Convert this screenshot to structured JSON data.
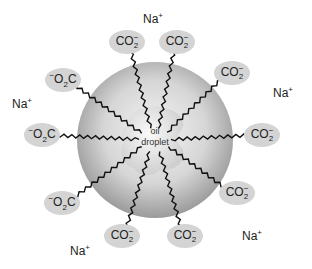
{
  "diagram": {
    "type": "soap-micelle",
    "center_label": [
      "oil",
      "droplet"
    ],
    "colors": {
      "sphere": "#c8c8c8",
      "head_group": "#d4d4d4",
      "tail": "#111111",
      "text": "#222222"
    },
    "head_groups": [
      {
        "id": "h1",
        "label": "CO2-",
        "x": 127,
        "y": 42
      },
      {
        "id": "h2",
        "label": "CO2-",
        "x": 177,
        "y": 42
      },
      {
        "id": "h3",
        "label": "CO2-",
        "x": 232,
        "y": 73
      },
      {
        "id": "h4",
        "label": "CO2-",
        "x": 262,
        "y": 135
      },
      {
        "id": "h5",
        "label": "CO2-",
        "x": 237,
        "y": 193
      },
      {
        "id": "h6",
        "label": "CO2-",
        "x": 185,
        "y": 236
      },
      {
        "id": "h7",
        "label": "CO2-",
        "x": 122,
        "y": 236
      },
      {
        "id": "h8",
        "label": "-O2C",
        "x": 62,
        "y": 203
      },
      {
        "id": "h9",
        "label": "-O2C",
        "x": 42,
        "y": 135
      },
      {
        "id": "h10",
        "label": "-O2C",
        "x": 63,
        "y": 80
      }
    ],
    "counter_ions": [
      {
        "label": "Na+",
        "x": 153,
        "y": 18
      },
      {
        "label": "Na+",
        "x": 283,
        "y": 92
      },
      {
        "label": "Na+",
        "x": 22,
        "y": 103
      },
      {
        "label": "Na+",
        "x": 252,
        "y": 235
      },
      {
        "label": "Na+",
        "x": 80,
        "y": 250
      }
    ],
    "text": {
      "co2_main": "CO",
      "co2_sub": "2",
      "co2_sup": "−",
      "o2c_sup": "−",
      "o2c_main": "O",
      "o2c_sub": "2",
      "o2c_end": "C",
      "na_main": "Na",
      "na_sup": "+",
      "oil": "oil",
      "droplet": "droplet"
    }
  }
}
